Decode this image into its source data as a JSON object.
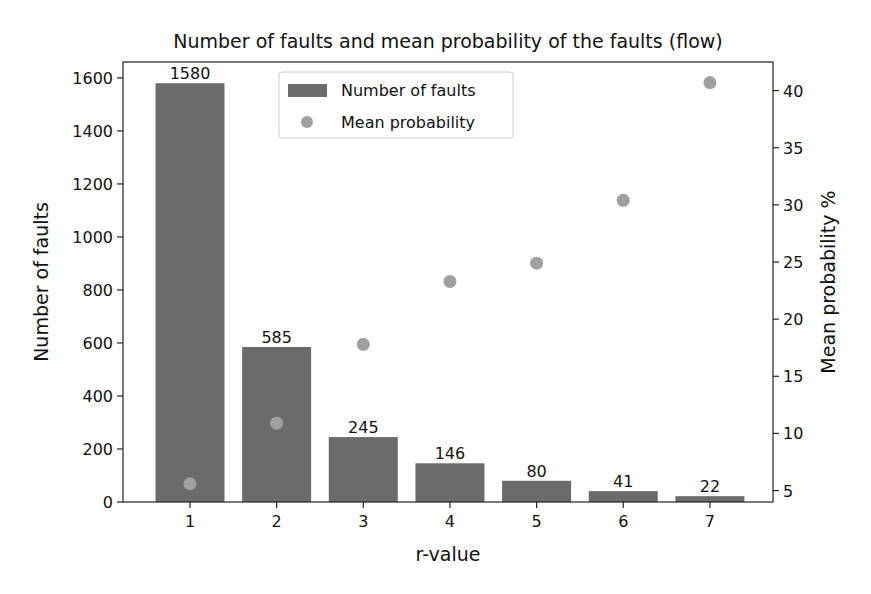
{
  "chart_data": {
    "type": "bar",
    "title": "Number of faults and mean probability of the faults (flow)",
    "xlabel": "r-value",
    "ylabel": "Number of faults",
    "ylabel_right": "Mean probability %",
    "categories": [
      "1",
      "2",
      "3",
      "4",
      "5",
      "6",
      "7"
    ],
    "series": [
      {
        "name": "Number of faults",
        "type": "bar",
        "axis": "left",
        "color": "#6b6b6b",
        "values": [
          1580,
          585,
          245,
          146,
          80,
          41,
          22
        ],
        "data_labels": [
          "1580",
          "585",
          "245",
          "146",
          "80",
          "41",
          "22"
        ]
      },
      {
        "name": "Mean probability",
        "type": "scatter",
        "axis": "right",
        "color": "#a0a0a0",
        "values": [
          5.6,
          10.9,
          17.8,
          23.3,
          24.9,
          30.4,
          40.7
        ]
      }
    ],
    "ylim": [
      0,
      1660
    ],
    "yticks": [
      0,
      200,
      400,
      600,
      800,
      1000,
      1200,
      1400,
      1600
    ],
    "ylim_right": [
      4.0,
      42.5
    ],
    "yticks_right": [
      5,
      10,
      15,
      20,
      25,
      30,
      35,
      40
    ],
    "grid": false,
    "legend": {
      "position": "upper center",
      "entries": [
        "Number of faults",
        "Mean probability"
      ]
    }
  }
}
